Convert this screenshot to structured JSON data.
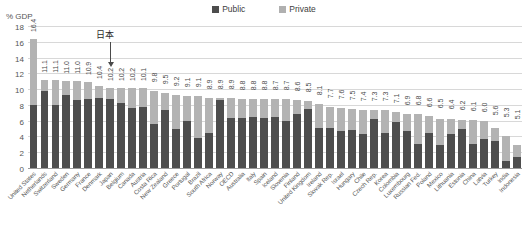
{
  "legend": {
    "position": "top-center",
    "items": [
      {
        "label": "Public",
        "color": "#4d4d4d",
        "icon": "square-swatch-icon"
      },
      {
        "label": "Private",
        "color": "#b3b3b3",
        "icon": "square-swatch-icon"
      }
    ]
  },
  "annotation": {
    "text": "日本",
    "points_to": "Japan"
  },
  "chart_data": {
    "type": "bar",
    "subtype": "stacked-vertical",
    "title": "",
    "xlabel": "",
    "ylabel": "% GDP",
    "ylim": [
      0,
      18
    ],
    "yticks": [
      0,
      2,
      4,
      6,
      8,
      10,
      12,
      14,
      16,
      18
    ],
    "grid": true,
    "legend_position": "top-center",
    "categories": [
      "United States",
      "Netherlands",
      "Switzerland",
      "Sweden",
      "Germany",
      "France",
      "Denmark",
      "Japan",
      "Belgium",
      "Canada",
      "Austria",
      "Costa Rica",
      "New Zealand",
      "Greece",
      "Portugal",
      "Brazil",
      "South Africa",
      "Norway",
      "OECD",
      "Australia",
      "Italy",
      "Spain",
      "Iceland",
      "Slovenia",
      "Finland",
      "United Kingdom",
      "Ireland",
      "Slovak Rep.",
      "Israel",
      "Hungary",
      "Chile",
      "Czech Rep.",
      "Korea",
      "Colombia",
      "Luxembourg",
      "Russian Fed.",
      "Poland",
      "Mexico",
      "Lithuania",
      "Estonia",
      "China",
      "Latvia",
      "Turkey",
      "India",
      "Indonesia"
    ],
    "totals": [
      16.4,
      11.1,
      11.1,
      11.0,
      11.0,
      10.9,
      10.4,
      10.2,
      10.2,
      10.2,
      10.1,
      9.8,
      9.5,
      9.2,
      9.1,
      9.1,
      8.9,
      8.9,
      8.9,
      8.8,
      8.8,
      8.8,
      8.7,
      8.7,
      8.6,
      8.5,
      8.1,
      7.7,
      7.6,
      7.5,
      7.4,
      7.3,
      7.3,
      7.1,
      6.9,
      6.8,
      6.6,
      6.5,
      6.4,
      6.2,
      6.1,
      6.0,
      5.6,
      5.3,
      5.1,
      4.0,
      2.9
    ],
    "series": [
      {
        "name": "Public",
        "color": "#4d4d4d",
        "values": [
          8.0,
          9.8,
          8.0,
          9.3,
          8.6,
          8.7,
          8.9,
          8.7,
          8.2,
          7.6,
          7.7,
          5.6,
          7.4,
          5.0,
          5.9,
          3.8,
          4.4,
          8.6,
          6.3,
          6.3,
          6.5,
          6.4,
          6.5,
          6.0,
          6.8,
          7.5,
          5.1,
          5.1,
          4.7,
          4.8,
          4.3,
          6.2,
          4.4,
          5.8,
          4.7,
          3.1,
          4.5,
          2.9,
          4.3,
          4.9,
          3.0,
          3.7,
          3.4,
          0.9,
          1.4
        ]
      },
      {
        "name": "Private",
        "color": "#b3b3b3",
        "values": [
          8.4,
          1.3,
          3.1,
          1.7,
          2.4,
          2.2,
          1.5,
          1.5,
          2.0,
          2.6,
          2.4,
          4.2,
          2.1,
          4.2,
          3.2,
          5.3,
          4.5,
          0.3,
          2.6,
          2.5,
          2.3,
          2.4,
          2.2,
          2.7,
          1.8,
          1.0,
          3.0,
          2.6,
          2.9,
          2.7,
          3.1,
          1.1,
          2.9,
          1.3,
          2.2,
          3.7,
          2.1,
          3.3,
          1.9,
          1.2,
          3.1,
          2.3,
          1.7,
          3.1,
          1.5
        ]
      }
    ],
    "value_labels": [
      "16.4",
      "11.1",
      "11.1",
      "11.0",
      "11.0",
      "10.9",
      "10.4",
      "10.2",
      "10.2",
      "10.2",
      "10.1",
      "9.8",
      "9.5",
      "9.2",
      "9.1",
      "9.1",
      "8.9",
      "8.9",
      "8.9",
      "8.8",
      "8.8",
      "8.8",
      "8.7",
      "8.7",
      "8.6",
      "8.5",
      "8.1",
      "7.7",
      "7.6",
      "7.5",
      "7.4",
      "7.3",
      "7.3",
      "7.1",
      "6.9",
      "6.8",
      "6.6",
      "6.5",
      "6.4",
      "6.2",
      "6.1",
      "6.0",
      "5.6",
      "5.3",
      "5.1",
      "4.0",
      "2.9"
    ]
  }
}
